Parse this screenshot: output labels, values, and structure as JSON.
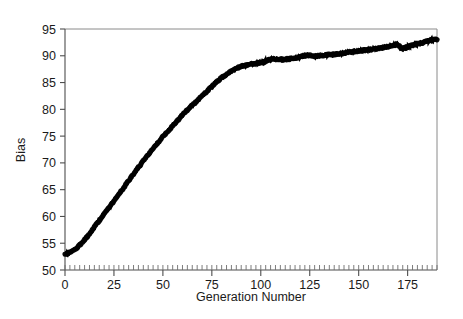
{
  "chart_data": {
    "type": "line",
    "title": "",
    "subtitle": "",
    "xlabel": "Generation Number",
    "ylabel": "Bias",
    "xlim": [
      0,
      190
    ],
    "ylim": [
      50,
      95
    ],
    "grid": false,
    "legend": null,
    "legend_position": "none",
    "x_ticks": [
      0,
      25,
      50,
      75,
      100,
      125,
      150,
      175
    ],
    "x_tick_labels": [
      "0",
      "25",
      "50",
      "75",
      "100",
      "125",
      "150",
      "175"
    ],
    "x_minor_tick_step": 2.5,
    "y_ticks": [
      50,
      55,
      60,
      65,
      70,
      75,
      80,
      85,
      90,
      95
    ],
    "y_tick_labels": [
      "50",
      "55",
      "60",
      "65",
      "70",
      "75",
      "80",
      "85",
      "90",
      "95"
    ],
    "line_color": "#000000",
    "line_width": 5,
    "background_color": "#ffffff",
    "frame_color": "#8a8a8a",
    "series": [
      {
        "name": "Bias",
        "x": [
          0,
          2,
          4,
          6,
          8,
          10,
          12,
          14,
          16,
          18,
          20,
          22,
          24,
          26,
          28,
          30,
          32,
          34,
          36,
          38,
          40,
          42,
          44,
          46,
          48,
          50,
          52,
          54,
          56,
          58,
          60,
          62,
          64,
          66,
          68,
          70,
          72,
          74,
          76,
          78,
          80,
          82,
          84,
          86,
          88,
          90,
          92,
          94,
          96,
          98,
          100,
          102,
          104,
          106,
          108,
          110,
          112,
          114,
          116,
          118,
          120,
          122,
          124,
          126,
          128,
          130,
          132,
          134,
          136,
          138,
          140,
          142,
          144,
          146,
          148,
          150,
          152,
          154,
          156,
          158,
          160,
          162,
          164,
          166,
          168,
          170,
          172,
          174,
          176,
          178,
          180,
          182,
          184,
          186,
          188,
          190
        ],
        "y": [
          53.0,
          53.2,
          53.6,
          54.1,
          54.8,
          55.6,
          56.5,
          57.5,
          58.5,
          59.5,
          60.5,
          61.5,
          62.4,
          63.4,
          64.4,
          65.4,
          66.4,
          67.4,
          68.4,
          69.4,
          70.4,
          71.3,
          72.2,
          73.1,
          74.0,
          74.9,
          75.7,
          76.5,
          77.3,
          78.1,
          78.9,
          79.7,
          80.4,
          81.1,
          81.8,
          82.5,
          83.2,
          83.9,
          84.6,
          85.3,
          85.9,
          86.4,
          86.9,
          87.3,
          87.7,
          88.0,
          88.2,
          88.4,
          88.5,
          88.6,
          88.7,
          88.9,
          89.2,
          89.4,
          89.4,
          89.3,
          89.3,
          89.4,
          89.5,
          89.6,
          89.8,
          90.0,
          90.1,
          90.0,
          89.9,
          90.0,
          90.1,
          90.2,
          90.2,
          90.3,
          90.4,
          90.5,
          90.6,
          90.7,
          90.8,
          90.9,
          91.0,
          91.1,
          91.2,
          91.3,
          91.4,
          91.5,
          91.6,
          91.8,
          92.0,
          92.1,
          91.3,
          91.5,
          91.8,
          92.0,
          92.2,
          92.4,
          92.6,
          92.8,
          93.0,
          93.1
        ]
      }
    ],
    "annotations": []
  }
}
